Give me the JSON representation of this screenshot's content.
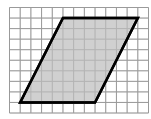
{
  "figure": {
    "grid": {
      "columns": 13,
      "rows": 10
    },
    "shape": {
      "type": "parallelogram",
      "vertices_grid_units": [
        [
          5,
          1
        ],
        [
          12,
          1
        ],
        [
          8,
          9
        ],
        [
          1,
          9
        ]
      ],
      "fill_color": "#c8c8c8",
      "stroke_color": "#000000"
    },
    "grid_color": "#9a9a9a",
    "background_color": "#ffffff"
  }
}
